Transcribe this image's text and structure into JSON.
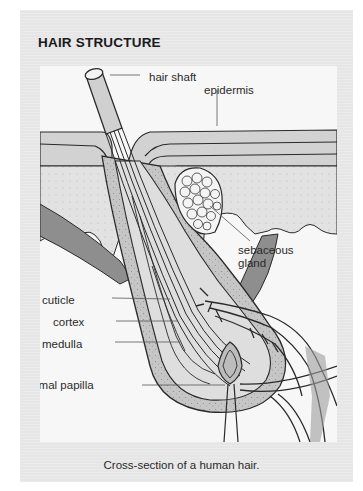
{
  "figure": {
    "title": "HAIR STRUCTURE",
    "caption": "Cross-section of a human hair.",
    "labels": {
      "hair_shaft": "hair shaft",
      "epidermis": "epidermis",
      "sebaceous_gland_line1": "sebaceous",
      "sebaceous_gland_line2": "gland",
      "cuticle": "cuticle",
      "cortex": "cortex",
      "medulla": "medulla",
      "dermal_papilla": "dermal papilla"
    },
    "colors": {
      "panel_background": "#e6e6e6",
      "diagram_background": "#f7f7f7",
      "tissue_dark": "#9a9a9a",
      "tissue_mid": "#c4c4c4",
      "tissue_light": "#dcdcdc",
      "outline": "#2a2a2a"
    }
  }
}
